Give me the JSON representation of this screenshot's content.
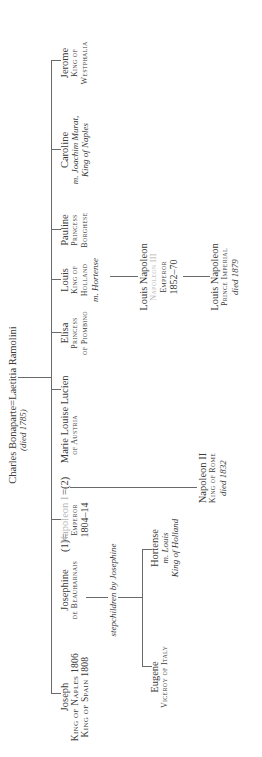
{
  "parents": {
    "father": "Charles Bonaparte",
    "marriage_sign": "=",
    "mother": "Laetitia Ramolini",
    "note": "(died 1785)"
  },
  "children": [
    {
      "name": "Joseph",
      "titles": [
        "King of Naples 1806",
        "King of Spain 1808"
      ]
    },
    {
      "name": "Napoleon I",
      "titles": [
        "Emperor",
        "1804–14"
      ]
    },
    {
      "name": "Lucien",
      "titles": []
    },
    {
      "name": "Elisa",
      "titles": [
        "Princess",
        "of Piombino"
      ]
    },
    {
      "name": "Louis",
      "titles": [
        "King of",
        "Holland"
      ],
      "spouse": "m. Hortense"
    },
    {
      "name": "Pauline",
      "titles": [
        "Princess",
        "Borghese"
      ]
    },
    {
      "name": "Caroline",
      "spouse": "m. Joachim Murat,",
      "spouse_title": "King of Naples"
    },
    {
      "name": "Jerome",
      "titles": [
        "King of",
        "Westphalia"
      ]
    }
  ],
  "napoleon_marriages": {
    "first_wife": "Josephine",
    "first_label": "(1)",
    "first_sign": "=",
    "first_wife_title": "de Beauharnais",
    "second_sign": "=",
    "second_label": "(2)",
    "second_wife": "Marie Louise",
    "second_wife_title": "of Austria"
  },
  "stepchildren": {
    "label": "stepchildren by Josephine",
    "eugene": {
      "name": "Eugene",
      "title": "Viceroy of Italy"
    },
    "hortense": {
      "name": "Hortense",
      "spouse": "m. Louis",
      "spouse_title": "King of Holland"
    }
  },
  "napoleon_ii": {
    "name": "Napoleon II",
    "title": "King of Rome",
    "note": "died 1832"
  },
  "napoleon_iii": {
    "name": "Louis Napoleon",
    "regnal": "Napoleon III",
    "title": "Emperor",
    "years": "1852–70"
  },
  "prince_imperial": {
    "name": "Louis Napoleon",
    "title": "Prince Imperial",
    "note": "died 1879"
  }
}
